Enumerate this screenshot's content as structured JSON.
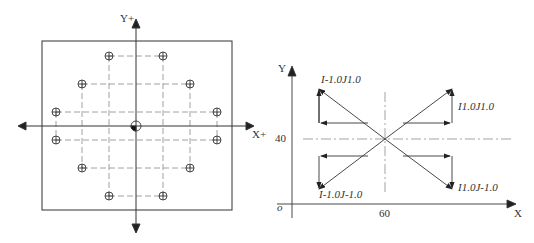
{
  "left_diagram": {
    "y_axis_label": "Y+",
    "x_axis_label": "X+",
    "hole_count": 12
  },
  "right_diagram": {
    "y_axis_label": "Y",
    "x_axis_label": "X",
    "origin_label": "o",
    "y_tick_label": "40",
    "x_tick_label": "60",
    "labels": {
      "top_left": "I-1.0J1.0",
      "top_right": "I1.0J1.0",
      "bottom_left": "I-1.0J-1.0",
      "bottom_right": "I1.0J-1.0"
    }
  }
}
